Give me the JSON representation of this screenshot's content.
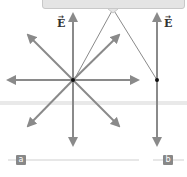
{
  "diagram": {
    "callout": {
      "text": ""
    },
    "field_label": "E",
    "field_label_vector_mark": "→",
    "panels": [
      {
        "id": "a",
        "label": "a",
        "description": "Point charge with electric field lines radiating in 8 directions"
      },
      {
        "id": "b",
        "label": "b",
        "description": "Single vertical electric field line through a point"
      }
    ],
    "colors": {
      "arrow": "#8a8a8a",
      "dot": "#111111",
      "tag_bg": "#888888",
      "band": "#e9e9e9",
      "callout_bg": "#e4e4e4"
    }
  }
}
